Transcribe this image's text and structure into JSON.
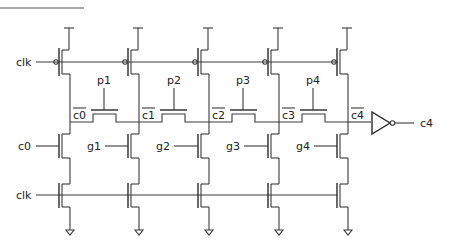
{
  "diagram": {
    "inputs": {
      "clk_top": "clk",
      "clk_bottom": "clk",
      "carry_in": "c0"
    },
    "propagate_labels": [
      "p1",
      "p2",
      "p3",
      "p4"
    ],
    "generate_labels": [
      "g1",
      "g2",
      "g3",
      "g4"
    ],
    "carry_node_labels": [
      "c0",
      "c1",
      "c2",
      "c3",
      "c4"
    ],
    "carry_nodes_inverted": true,
    "output": {
      "label": "c4",
      "via": "inverter"
    },
    "colors": {
      "wire": "#3a3a3a",
      "text": "#222222",
      "background": "#ffffff"
    }
  }
}
